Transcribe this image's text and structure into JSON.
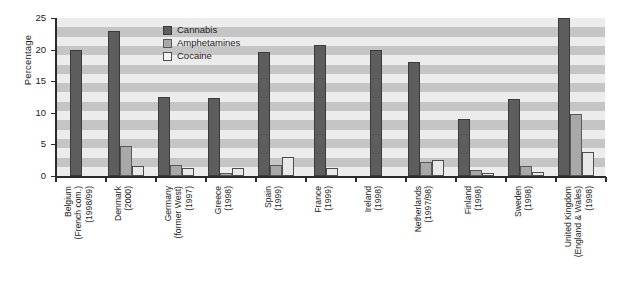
{
  "chart_data": {
    "type": "bar",
    "title": "",
    "xlabel": "",
    "ylabel": "Percentage",
    "ylim": [
      0,
      25
    ],
    "yticks": [
      0,
      5,
      10,
      15,
      20,
      25
    ],
    "grid": "horizontal-bands",
    "legend_position": "inside-top-center",
    "categories": [
      "Belgium (French com.) (1998/99)",
      "Denmark (2000)",
      "Germany (former West) (1997)",
      "Greece (1998)",
      "Spain (1999)",
      "France (1999)",
      "Ireland (1998)",
      "Netherlands (1997/98)",
      "Finland (1998)",
      "Sweden (1998)",
      "United Kingdom (England & Wales) (1998)"
    ],
    "category_lines": [
      [
        "Belgium",
        "(French com.)",
        "(1998/99)"
      ],
      [
        "Denmark",
        "(2000)"
      ],
      [
        "Germany",
        "(former West)",
        "(1997)"
      ],
      [
        "Greece",
        "(1998)"
      ],
      [
        "Spain",
        "(1999)"
      ],
      [
        "France",
        "(1999)"
      ],
      [
        "Ireland",
        "(1998)"
      ],
      [
        "Netherlands",
        "(1997/98)"
      ],
      [
        "Finland",
        "(1998)"
      ],
      [
        "Sweden",
        "(1998)"
      ],
      [
        "United Kingdom",
        "(England & Wales)",
        "(1998)"
      ]
    ],
    "series": [
      {
        "name": "Cannabis",
        "color": "#5d5d5d",
        "values": [
          20.0,
          23.0,
          12.5,
          12.3,
          19.7,
          20.7,
          20.0,
          18.0,
          9.0,
          12.2,
          25.0
        ]
      },
      {
        "name": "Amphetamines",
        "color": "#a8a8a8",
        "values": [
          null,
          4.7,
          1.7,
          0.5,
          1.7,
          null,
          null,
          2.2,
          1.0,
          1.6,
          9.8
        ]
      },
      {
        "name": "Cocaine",
        "color": "#e8e8e8",
        "values": [
          null,
          1.6,
          1.3,
          1.2,
          3.0,
          1.3,
          null,
          2.5,
          0.4,
          0.7,
          3.8
        ]
      }
    ]
  },
  "legend": {
    "items": [
      {
        "label": "Cannabis"
      },
      {
        "label": "Amphetamines"
      },
      {
        "label": "Cocaine"
      }
    ]
  },
  "axis": {
    "y_label": "Percentage",
    "y_ticks": [
      "0",
      "5",
      "10",
      "15",
      "20",
      "25"
    ]
  }
}
